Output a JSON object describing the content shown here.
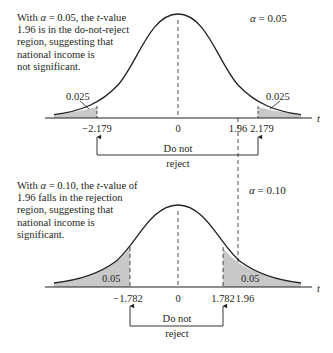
{
  "panels": [
    {
      "id": "top",
      "note_parts": {
        "l1a": "With ",
        "l1_alpha": "α",
        "l1b": " = 0.05, the ",
        "l1_t": "t",
        "l1c": "-value",
        "rest": "1.96 is in the do-not-reject\nregion, suggesting that\nnational income is\nnot significant."
      },
      "alpha_symbol": "α",
      "alpha_value": " = 0.05",
      "left_tail_area": "0.025",
      "right_tail_area": "0.025",
      "ticks": {
        "left_crit": "−2.179",
        "center": "0",
        "t_value": "1.96",
        "right_crit": "2.179"
      },
      "axis_label": "t",
      "bracket_label_line1": "Do not",
      "bracket_label_line2": "reject"
    },
    {
      "id": "bottom",
      "note_parts": {
        "l1a": "With ",
        "l1_alpha": "α",
        "l1b": " = 0.10, the ",
        "l1_t": "t",
        "l1c": "-value of",
        "rest": "1.96 falls in the rejection\nregion, suggesting that\nnational income is\nsignificant."
      },
      "alpha_symbol": "α",
      "alpha_value": " = 0.10",
      "left_tail_area": "0.05",
      "right_tail_area": "0.05",
      "ticks": {
        "left_crit": "−1.782",
        "center": "0",
        "right_crit": "1.782",
        "t_value": "1.96"
      },
      "axis_label": "t",
      "bracket_label_line1": "Do not",
      "bracket_label_line2": "reject"
    }
  ],
  "colors": {
    "ink": "#231f20",
    "shade": "#c8c8c8"
  }
}
